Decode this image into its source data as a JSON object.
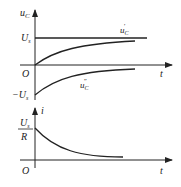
{
  "top_plot": {
    "y_axis_label": "u",
    "y_axis_sub": "C",
    "x_axis_label": "t",
    "origin_label": "O",
    "us_label": "U",
    "us_sub": "s",
    "neg_us_label": "−U",
    "neg_us_sub": "s",
    "curve_steady_label": "u",
    "curve_steady_sub": "C",
    "curve_steady_prime": "′",
    "curve_transient_label": "u",
    "curve_transient_sub": "C",
    "curve_transient_prime": "″"
  },
  "bottom_plot": {
    "y_axis_label": "i",
    "x_axis_label": "t",
    "origin_label": "O",
    "initial_num": "U",
    "initial_num_sub": "s",
    "initial_den": "R"
  },
  "colors": {
    "line": "#222222"
  }
}
